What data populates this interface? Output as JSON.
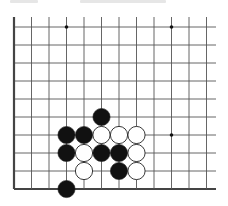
{
  "board": {
    "view": "lower-left corner fragment of go board (cropped top and right)",
    "columns_visible": 12,
    "rows_visible": 10,
    "grid_x": [
      14,
      31.5,
      49,
      66.5,
      84,
      101.5,
      119,
      136.5,
      154,
      171.5,
      189,
      206.5
    ],
    "grid_y": [
      27,
      45,
      63,
      81,
      99,
      117,
      135,
      153,
      171,
      189
    ],
    "line_color": "#555555",
    "edge_color": "#444444",
    "star_points": [
      {
        "col": 3,
        "row": 0
      },
      {
        "col": 9,
        "row": 0
      },
      {
        "col": 9,
        "row": 6
      }
    ],
    "stones": [
      {
        "color": "black",
        "col": 5,
        "row": 5
      },
      {
        "color": "black",
        "col": 3,
        "row": 6
      },
      {
        "color": "black",
        "col": 4,
        "row": 6
      },
      {
        "color": "white",
        "col": 5,
        "row": 6
      },
      {
        "color": "white",
        "col": 6,
        "row": 6
      },
      {
        "color": "white",
        "col": 7,
        "row": 6
      },
      {
        "color": "black",
        "col": 3,
        "row": 7
      },
      {
        "color": "white",
        "col": 4,
        "row": 7
      },
      {
        "color": "black",
        "col": 5,
        "row": 7
      },
      {
        "color": "black",
        "col": 6,
        "row": 7
      },
      {
        "color": "white",
        "col": 7,
        "row": 7
      },
      {
        "color": "white",
        "col": 4,
        "row": 8
      },
      {
        "color": "black",
        "col": 6,
        "row": 8
      },
      {
        "color": "white",
        "col": 7,
        "row": 8
      },
      {
        "color": "black",
        "col": 3,
        "row": 9
      }
    ],
    "stone_radius": 8.6
  }
}
